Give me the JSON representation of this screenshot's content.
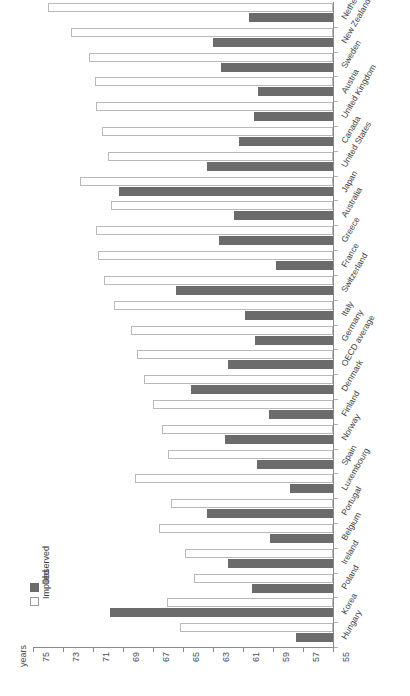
{
  "chart_data": {
    "type": "bar",
    "orientation": "horizontal-reversed",
    "title": "",
    "xlabel": "years",
    "ylabel": "",
    "xlim": [
      75,
      55
    ],
    "xticks": [
      75,
      73,
      71,
      69,
      67,
      65,
      63,
      61,
      59,
      57,
      55
    ],
    "grid": false,
    "legend_position": "bottom-left",
    "categories": [
      "Netherlands",
      "New Zealand",
      "Sweden",
      "Austria",
      "United Kingdom",
      "Canada",
      "United States",
      "Japan",
      "Australia",
      "Greece",
      "France",
      "Switzerland",
      "Italy",
      "Germany",
      "OECD average",
      "Denmark",
      "Finland",
      "Norway",
      "Spain",
      "Luxembourg",
      "Portugal",
      "Belgium",
      "Ireland",
      "Poland",
      "Korea",
      "Hungary"
    ],
    "series": [
      {
        "name": "Observed",
        "color": "#6b6b6b",
        "values": [
          60.6,
          63.0,
          62.5,
          60.0,
          60.3,
          61.3,
          63.4,
          69.3,
          61.6,
          62.6,
          58.8,
          65.5,
          60.9,
          60.2,
          62.0,
          64.5,
          59.3,
          62.2,
          60.1,
          57.9,
          63.4,
          59.2,
          62.0,
          60.4,
          69.9,
          57.5
        ]
      },
      {
        "name": "Implied",
        "color": "#ffffff",
        "values": [
          74.0,
          72.5,
          71.3,
          70.9,
          70.8,
          70.4,
          70.0,
          71.9,
          69.8,
          70.8,
          70.7,
          70.3,
          69.6,
          68.5,
          68.1,
          67.6,
          67.0,
          66.4,
          66.0,
          68.2,
          65.8,
          66.6,
          64.9,
          64.3,
          66.1,
          65.2
        ]
      }
    ]
  },
  "legend": {
    "observed_label": "Observed",
    "implied_label": "Implied"
  },
  "axis": {
    "units_label": "years"
  }
}
